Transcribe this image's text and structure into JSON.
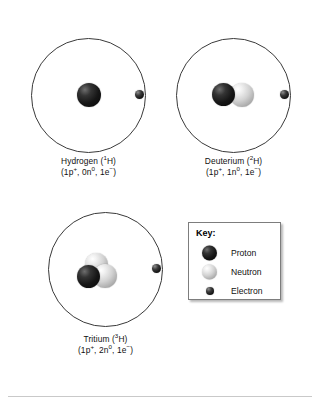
{
  "figure": {
    "background_color": "#ffffff",
    "orbit_color": "#3a3a3a",
    "proton_color": "#161616",
    "neutron_color": "#d2d2d2",
    "electron_color": "#151515"
  },
  "atoms": [
    {
      "id": "hydrogen",
      "name_line": "Hydrogen (¹H)",
      "name_text": "Hydrogen (",
      "mass_number": "1",
      "element_symbol": "H)",
      "composition_text": "(1p⁺, 0n⁰, 1e⁻)",
      "composition": {
        "protons": 1,
        "neutrons": 0,
        "electrons": 1,
        "proton_part": "(1p",
        "proton_charge": "+",
        "neutron_part": ", 0n",
        "neutron_charge": "0",
        "electron_part": ", 1e",
        "electron_charge": "−",
        "close": ")"
      }
    },
    {
      "id": "deuterium",
      "name_line": "Deuterium (²H)",
      "name_text": "Deuterium (",
      "mass_number": "2",
      "element_symbol": "H)",
      "composition_text": "(1p⁺, 1n⁰, 1e⁻)",
      "composition": {
        "protons": 1,
        "neutrons": 1,
        "electrons": 1,
        "proton_part": "(1p",
        "proton_charge": "+",
        "neutron_part": ", 1n",
        "neutron_charge": "0",
        "electron_part": ", 1e",
        "electron_charge": "−",
        "close": ")"
      }
    },
    {
      "id": "tritium",
      "name_line": "Tritium (³H)",
      "name_text": "Tritium (",
      "mass_number": "3",
      "element_symbol": "H)",
      "composition_text": "(1p⁺, 2n⁰, 1e⁻)",
      "composition": {
        "protons": 1,
        "neutrons": 2,
        "electrons": 1,
        "proton_part": "(1p",
        "proton_charge": "+",
        "neutron_part": ", 2n",
        "neutron_charge": "0",
        "electron_part": ", 1e",
        "electron_charge": "−",
        "close": ")"
      }
    }
  ],
  "key": {
    "title": "Key:",
    "items": [
      {
        "label": "Proton",
        "icon": "proton-sphere-icon"
      },
      {
        "label": "Neutron",
        "icon": "neutron-sphere-icon"
      },
      {
        "label": "Electron",
        "icon": "electron-sphere-icon"
      }
    ]
  }
}
